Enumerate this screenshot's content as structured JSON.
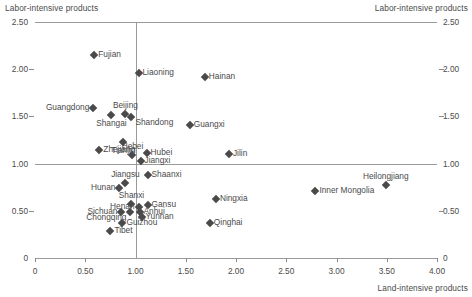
{
  "chart_data": {
    "type": "scatter",
    "title": "",
    "xlabel": "Land-intensive products",
    "ylabel": "Labor-intensive products",
    "ylabel_left_top": "Labor-intensive products",
    "ylabel_right_top": "Labor-intensive products",
    "xlim": [
      0,
      4.0
    ],
    "ylim": [
      0,
      2.5
    ],
    "xticks": [
      "0",
      "0.50",
      "1.00",
      "1.50",
      "2.00",
      "2.50",
      "3.00",
      "3.50",
      "4.00"
    ],
    "xtick_values": [
      0,
      0.5,
      1.0,
      1.5,
      2.0,
      2.5,
      3.0,
      3.5,
      4.0
    ],
    "yticks": [
      "0",
      "0.50",
      "1.00",
      "1.50",
      "2.00",
      "2.50"
    ],
    "ytick_values": [
      0,
      0.5,
      1.0,
      1.5,
      2.0,
      2.5
    ],
    "grid": false,
    "reference_lines": {
      "vertical_x": 1.0,
      "horizontal_y": 1.0,
      "top_y": 2.5
    },
    "legend": "none",
    "marker": "diamond",
    "marker_color": "#4a4a4a",
    "points": [
      {
        "label": "Fujian",
        "x": 0.59,
        "y": 2.15,
        "pos": "right"
      },
      {
        "label": "Liaoning",
        "x": 1.03,
        "y": 1.96,
        "pos": "right"
      },
      {
        "label": "Hainan",
        "x": 1.69,
        "y": 1.92,
        "pos": "right"
      },
      {
        "label": "Guangdong",
        "x": 0.58,
        "y": 1.59,
        "pos": "left"
      },
      {
        "label": "Beijing",
        "x": 0.9,
        "y": 1.53,
        "pos": "above"
      },
      {
        "label": "Shangai",
        "x": 0.76,
        "y": 1.51,
        "pos": "below"
      },
      {
        "label": "Shandong",
        "x": 0.96,
        "y": 1.49,
        "pos": "below-right"
      },
      {
        "label": "Guangxi",
        "x": 1.54,
        "y": 1.41,
        "pos": "right"
      },
      {
        "label": "Tianjin",
        "x": 0.88,
        "y": 1.23,
        "pos": "below"
      },
      {
        "label": "Zhejiang",
        "x": 0.64,
        "y": 1.14,
        "pos": "right"
      },
      {
        "label": "Hebei",
        "x": 0.97,
        "y": 1.09,
        "pos": "above"
      },
      {
        "label": "Hubei",
        "x": 1.11,
        "y": 1.11,
        "pos": "right"
      },
      {
        "label": "Jiangxi",
        "x": 1.05,
        "y": 1.03,
        "pos": "right"
      },
      {
        "label": "Jilin",
        "x": 1.93,
        "y": 1.1,
        "pos": "right"
      },
      {
        "label": "Jiangsu",
        "x": 0.9,
        "y": 0.79,
        "pos": "above"
      },
      {
        "label": "Shaanxi",
        "x": 1.12,
        "y": 0.88,
        "pos": "right"
      },
      {
        "label": "Hunan",
        "x": 0.84,
        "y": 0.74,
        "pos": "left"
      },
      {
        "label": "Heilongjiang",
        "x": 3.49,
        "y": 0.77,
        "pos": "above"
      },
      {
        "label": "Inner Mongolia",
        "x": 2.79,
        "y": 0.71,
        "pos": "right"
      },
      {
        "label": "Ningxia",
        "x": 1.8,
        "y": 0.63,
        "pos": "right"
      },
      {
        "label": "Shanxi",
        "x": 0.96,
        "y": 0.57,
        "pos": "above"
      },
      {
        "label": "Henan",
        "x": 1.03,
        "y": 0.54,
        "pos": "left"
      },
      {
        "label": "Gansu",
        "x": 1.12,
        "y": 0.56,
        "pos": "right"
      },
      {
        "label": "Sichuan",
        "x": 0.86,
        "y": 0.49,
        "pos": "left"
      },
      {
        "label": "Chongqing",
        "x": 0.95,
        "y": 0.49,
        "pos": "below-left"
      },
      {
        "label": "Anhui",
        "x": 1.04,
        "y": 0.49,
        "pos": "right"
      },
      {
        "label": "Yunnan",
        "x": 1.06,
        "y": 0.43,
        "pos": "right"
      },
      {
        "label": "Guizhou",
        "x": 0.87,
        "y": 0.37,
        "pos": "right"
      },
      {
        "label": "Qinghai",
        "x": 1.74,
        "y": 0.37,
        "pos": "right"
      },
      {
        "label": "Tibet",
        "x": 0.75,
        "y": 0.29,
        "pos": "right"
      }
    ]
  }
}
